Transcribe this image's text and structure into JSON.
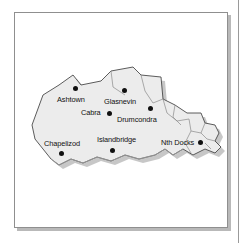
{
  "figure": {
    "kind": "region-map",
    "region_name": "Dublin North City and Western Districts",
    "frame": {
      "border_color": "#8f8f8f",
      "background": "#ffffff"
    }
  },
  "map": {
    "land_fill": "#ececec",
    "land_outline": "#4a4a4a",
    "shadow_color": "#bdbdbd",
    "marker_color": "#101010",
    "label_color": "#111111",
    "places": [
      {
        "name": "Ashtown",
        "label_x": 42,
        "label_y": 87,
        "dot_x": 61,
        "dot_y": 76
      },
      {
        "name": "Cabra",
        "label_x": 66,
        "label_y": 100,
        "dot_x": 95,
        "dot_y": 101
      },
      {
        "name": "Glasnevin",
        "label_x": 91,
        "label_y": 89,
        "dot_x": 110,
        "dot_y": 78
      },
      {
        "name": "Drumcondra",
        "label_x": 104,
        "label_y": 107,
        "dot_x": 136,
        "dot_y": 96
      },
      {
        "name": "Chapelizod",
        "label_x": 31,
        "label_y": 131,
        "dot_x": 47,
        "dot_y": 141
      },
      {
        "name": "Islandbridge",
        "label_x": 84,
        "label_y": 127,
        "dot_x": 98,
        "dot_y": 138
      },
      {
        "name": "Nth Docks",
        "label_x": 148,
        "label_y": 130,
        "dot_x": 186,
        "dot_y": 130
      }
    ]
  }
}
